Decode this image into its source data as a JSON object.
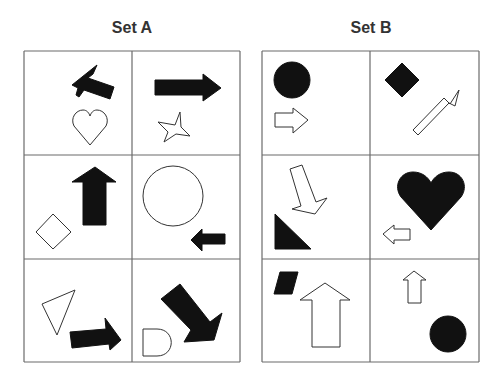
{
  "colors": {
    "grid": "#6b6b6b",
    "filled": "#111111",
    "outline": "#333333",
    "title": "#333333",
    "background": "#ffffff"
  },
  "sets": [
    {
      "id": "set-a",
      "title": "Set A",
      "title_x": 132,
      "title_y": 33,
      "grid": {
        "x": [
          24,
          132,
          240
        ],
        "y": [
          51,
          155,
          259,
          362
        ]
      },
      "cells": [
        {
          "row": 0,
          "col": 0,
          "shapes": [
            {
              "name": "filled-arrow-up-left",
              "style": "filled",
              "d": "M97,65 L72,85 L78,88 L76,95 L79,97 L84,90 L110,99 L114,87 L88,78 L93,74 Z"
            },
            {
              "name": "outline-heart",
              "style": "outline",
              "d": "M90,145 L74,126 C70,118 76,110 83,110 C87,110 89,113 90,116 C91,113 93,110 97,110 C104,110 110,118 106,126 Z"
            }
          ]
        },
        {
          "row": 0,
          "col": 1,
          "shapes": [
            {
              "name": "filled-arrow-right",
              "style": "filled",
              "d": "M155,80 L203,80 L203,74 L221,88 L203,101 L203,95 L155,95 Z"
            },
            {
              "name": "outline-star",
              "style": "outline",
              "d": "M180,112 L175,125 L158,122 L168,132 L164,142 L176,134 L190,136 L181,127 Z"
            }
          ]
        },
        {
          "row": 1,
          "col": 0,
          "shapes": [
            {
              "name": "filled-arrow-up",
              "style": "filled",
              "d": "M95,167 L116,182 L106,182 L106,225 L83,225 L83,182 L72,182 Z"
            },
            {
              "name": "outline-diamond",
              "style": "outline",
              "d": "M53,214 L71,232 L53,249 L36,232 Z"
            }
          ]
        },
        {
          "row": 1,
          "col": 1,
          "shapes": [
            {
              "name": "outline-circle",
              "style": "outline",
              "circle": [
                173,
                196,
                30
              ]
            },
            {
              "name": "filled-arrow-left",
              "style": "filled",
              "d": "M191,240 L202,229 L202,234 L225,234 L225,244 L202,244 L202,251 Z"
            }
          ]
        },
        {
          "row": 2,
          "col": 0,
          "shapes": [
            {
              "name": "outline-triangle",
              "style": "outline",
              "d": "M42,304 L75,290 L57,335 Z"
            },
            {
              "name": "filled-arrow-right-tilted",
              "style": "filled",
              "d": "M70,332 L106,329 L105,318 L121,340 L110,350 L109,344 L72,348 Z"
            }
          ]
        },
        {
          "row": 2,
          "col": 1,
          "shapes": [
            {
              "name": "filled-arrow-down-right",
              "style": "filled",
              "d": "M180,284 L161,299 L191,330 L184,342 L214,340 L222,313 L210,322 Z"
            },
            {
              "name": "outline-d-shape",
              "style": "outline",
              "d": "M143,329 L157,329 C176,329 176,356 157,356 L143,356 Z"
            }
          ]
        }
      ]
    },
    {
      "id": "set-b",
      "title": "Set B",
      "title_x": 371,
      "title_y": 33,
      "grid": {
        "x": [
          262,
          370,
          479
        ],
        "y": [
          51,
          155,
          259,
          362
        ]
      },
      "cells": [
        {
          "row": 0,
          "col": 0,
          "shapes": [
            {
              "name": "filled-circle",
              "style": "filled",
              "circle": [
                292,
                80,
                18
              ]
            },
            {
              "name": "outline-arrow-right",
              "style": "outline",
              "d": "M275,113 L293,113 L293,108 L308,120 L293,133 L293,127 L275,127 Z"
            }
          ]
        },
        {
          "row": 0,
          "col": 1,
          "shapes": [
            {
              "name": "filled-diamond",
              "style": "filled",
              "d": "M402,63 L419,80 L402,97 L385,80 Z"
            },
            {
              "name": "outline-arrow-up-right",
              "style": "outline",
              "d": "M413,130 L444,98 L450,104 L459,90 L455,106 L449,103 L418,135 Z"
            }
          ]
        },
        {
          "row": 1,
          "col": 0,
          "shapes": [
            {
              "name": "outline-arrow-down",
              "style": "outline",
              "d": "M290,169 L302,165 L316,202 L327,198 L315,214 L292,209 L301,206 Z"
            },
            {
              "name": "filled-right-triangle",
              "style": "filled",
              "d": "M275,214 L275,249 L311,249 Z"
            }
          ]
        },
        {
          "row": 1,
          "col": 1,
          "shapes": [
            {
              "name": "filled-heart",
              "style": "filled",
              "d": "M431,230 L401,197 C393,186 400,172 413,172 C422,172 428,177 431,183 C434,177 440,172 449,172 C462,172 469,186 461,197 Z"
            },
            {
              "name": "outline-arrow-left",
              "style": "outline",
              "d": "M383,234 L394,225 L394,229 L410,229 L410,240 L394,240 L394,244 Z"
            }
          ]
        },
        {
          "row": 2,
          "col": 0,
          "shapes": [
            {
              "name": "filled-parallelogram",
              "style": "filled",
              "d": "M280,272 L298,272 L292,294 L274,294 Z"
            },
            {
              "name": "outline-arrow-up-large",
              "style": "outline",
              "d": "M325,283 L350,300 L340,300 L340,347 L312,347 L312,300 L300,300 Z"
            }
          ]
        },
        {
          "row": 2,
          "col": 1,
          "shapes": [
            {
              "name": "outline-arrow-up-small",
              "style": "outline",
              "d": "M414,271 L426,280 L421,280 L421,303 L408,303 L408,280 L403,280 Z"
            },
            {
              "name": "filled-circle-small",
              "style": "filled",
              "circle": [
                448,
                334,
                18
              ]
            }
          ]
        }
      ]
    }
  ]
}
